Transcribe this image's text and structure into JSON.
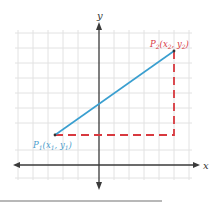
{
  "figure": {
    "axes": {
      "x_label": "x",
      "y_label": "y"
    },
    "points": {
      "p1": {
        "name": "P",
        "sub": "1",
        "coords": "(x",
        "c1sub": "1",
        "sep": ", y",
        "c2sub": "1",
        "close": ")"
      },
      "p2": {
        "name": "P",
        "sub": "2",
        "coords": "(x",
        "c1sub": "2",
        "sep": ", y",
        "c2sub": "2",
        "close": ")"
      }
    },
    "colors": {
      "segment": "#3a9fd0",
      "dashed": "#d8393f",
      "axis": "#3a3a3a",
      "grid": "#e2e2e2",
      "p1_label": "#4a9ccc",
      "p2_label": "#d8393f"
    }
  }
}
